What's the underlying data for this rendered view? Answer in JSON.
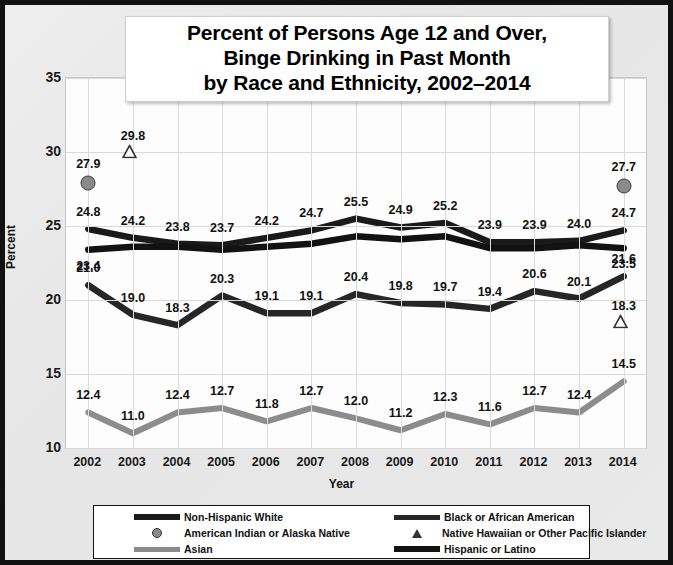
{
  "title": {
    "line1": "Percent of Persons Age 12 and Over,",
    "line2": "Binge Drinking in Past Month",
    "line3": "by Race and Ethnicity, 2002–2014"
  },
  "axes": {
    "ylabel": "Percent",
    "xlabel": "Year",
    "yticks": [
      "35",
      "30",
      "25",
      "20",
      "15",
      "10"
    ],
    "xticks": [
      "2002",
      "2003",
      "2004",
      "2005",
      "2006",
      "2007",
      "2008",
      "2009",
      "2010",
      "2011",
      "2012",
      "2013",
      "2014"
    ]
  },
  "legend": {
    "items": [
      {
        "label": "Non-Hispanic White",
        "marker": "line-black-thick",
        "color": "#1a1a1a"
      },
      {
        "label": "Black or African American",
        "marker": "line-black",
        "color": "#262626"
      },
      {
        "label": "American Indian or Alaska Native",
        "marker": "circle-marker",
        "color": "#8a8a8a"
      },
      {
        "label": "Native Hawaiian or Other Pacific Islander",
        "marker": "triangle-marker",
        "color": "#333333"
      },
      {
        "label": "Asian",
        "marker": "line-gray",
        "color": "#8c8c8c"
      },
      {
        "label": "Hispanic or Latino",
        "marker": "line-black-thick",
        "color": "#121212"
      }
    ]
  },
  "chart_data": {
    "type": "line",
    "title": "Percent of Persons Age 12 and Over, Binge Drinking in Past Month by Race and Ethnicity, 2002–2014",
    "xlabel": "Year",
    "ylabel": "Percent",
    "ylim": [
      10,
      35
    ],
    "ytick_step": 5,
    "grid": true,
    "legend_position": "bottom",
    "categories": [
      "2002",
      "2003",
      "2004",
      "2005",
      "2006",
      "2007",
      "2008",
      "2009",
      "2010",
      "2011",
      "2012",
      "2013",
      "2014"
    ],
    "series": [
      {
        "name": "Non-Hispanic White",
        "color": "#1a1a1a",
        "style": "line",
        "values": [
          24.8,
          24.2,
          23.8,
          23.7,
          24.2,
          24.7,
          25.5,
          24.9,
          25.2,
          23.9,
          23.9,
          24.0,
          24.7
        ],
        "labels": [
          "24.8",
          "24.2",
          "23.8",
          "23.7",
          "24.2",
          "24.7",
          "25.5",
          "24.9",
          "25.2",
          "23.9",
          "23.9",
          "24.0",
          "24.7"
        ]
      },
      {
        "name": "Hispanic or Latino",
        "color": "#121212",
        "style": "line",
        "values": [
          23.4,
          23.6,
          23.6,
          23.4,
          23.6,
          23.8,
          24.3,
          24.1,
          24.3,
          23.5,
          23.5,
          23.7,
          23.5
        ],
        "labels": [
          "23.4",
          "",
          "",
          "",
          "",
          "",
          "",
          "",
          "",
          "",
          "",
          "",
          "23.5"
        ]
      },
      {
        "name": "Black or African American",
        "color": "#262626",
        "style": "line",
        "values": [
          21.0,
          19.0,
          18.3,
          20.3,
          19.1,
          19.1,
          20.4,
          19.8,
          19.7,
          19.4,
          20.6,
          20.1,
          21.6
        ],
        "labels": [
          "21.0",
          "19.0",
          "18.3",
          "20.3",
          "19.1",
          "19.1",
          "20.4",
          "19.8",
          "19.7",
          "19.4",
          "20.6",
          "20.1",
          "21.6"
        ]
      },
      {
        "name": "Asian",
        "color": "#8c8c8c",
        "style": "line",
        "values": [
          12.4,
          11.0,
          12.4,
          12.7,
          11.8,
          12.7,
          12.0,
          11.2,
          12.3,
          11.6,
          12.7,
          12.4,
          14.5
        ],
        "labels": [
          "12.4",
          "11.0",
          "12.4",
          "12.7",
          "11.8",
          "12.7",
          "12.0",
          "11.2",
          "12.3",
          "11.6",
          "12.7",
          "12.4",
          "14.5"
        ]
      },
      {
        "name": "American Indian or Alaska Native",
        "color": "#8a8a8a",
        "style": "marker-circle",
        "points": [
          {
            "x": "2002",
            "y": 27.9,
            "label": "27.9"
          },
          {
            "x": "2014",
            "y": 27.7,
            "label": "27.7"
          }
        ]
      },
      {
        "name": "Native Hawaiian or Other Pacific Islander",
        "color": "#333333",
        "style": "marker-triangle",
        "points": [
          {
            "x": "2003",
            "y": 29.8,
            "label": "29.8"
          },
          {
            "x": "2014",
            "y": 18.3,
            "label": "18.3"
          }
        ]
      }
    ]
  }
}
